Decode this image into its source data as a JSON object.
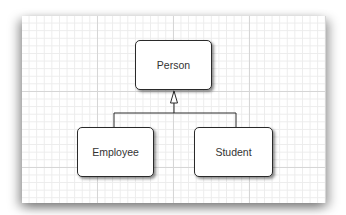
{
  "diagram": {
    "type": "UML class inheritance",
    "nodes": [
      {
        "id": "person",
        "label": "Person"
      },
      {
        "id": "employee",
        "label": "Employee"
      },
      {
        "id": "student",
        "label": "Student"
      }
    ],
    "edges": [
      {
        "from": "employee",
        "to": "person",
        "relation": "inherits",
        "arrow": "hollow-triangle"
      },
      {
        "from": "student",
        "to": "person",
        "relation": "inherits",
        "arrow": "hollow-triangle"
      }
    ],
    "colors": {
      "box_border": "#2a2a2a",
      "box_fill": "#ffffff",
      "text": "#333333",
      "grid_major": "#d6d6d6",
      "grid_minor": "#ececec"
    }
  }
}
